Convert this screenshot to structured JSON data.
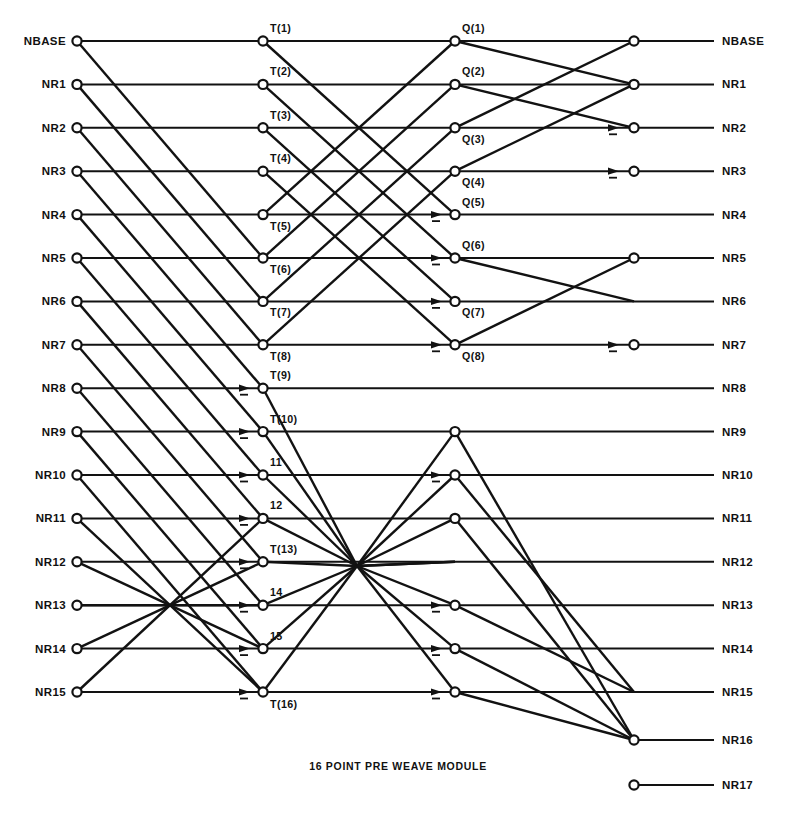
{
  "figure": {
    "caption": "16 POINT PRE WEAVE MODULE",
    "type": "butterfly-interconnect-network",
    "background": "#ffffff",
    "ink": "#121212"
  },
  "geometry": {
    "row_top_y": 41,
    "row_step_y": 43.4,
    "rows": 16,
    "col_input_x": 77,
    "col_t_x": 263,
    "col_q_x": 455,
    "col_out_x": 634,
    "label_in_x": 66,
    "label_out_x": 722,
    "line_left_x": 77,
    "line_right_x": 714,
    "hub_x": 357,
    "hub_y": 566,
    "extra_row_16_y": 740,
    "extra_row_17_y": 785
  },
  "inputs": {
    "labels": [
      "NBASE",
      "NR1",
      "NR2",
      "NR3",
      "NR4",
      "NR5",
      "NR6",
      "NR7",
      "NR8",
      "NR9",
      "NR10",
      "NR11",
      "NR12",
      "NR13",
      "NR14",
      "NR15"
    ]
  },
  "outputs": {
    "labels": [
      "NBASE",
      "NR1",
      "NR2",
      "NR3",
      "NR4",
      "NR5",
      "NR6",
      "NR7",
      "NR8",
      "NR9",
      "NR10",
      "NR11",
      "NR12",
      "NR13",
      "NR14",
      "NR15",
      "NR16",
      "NR17"
    ]
  },
  "stage_t": {
    "node_labels": [
      "T(1)",
      "T(2)",
      "T(3)",
      "T(4)",
      "T(5)",
      "T(6)",
      "T(7)",
      "T(8)",
      "T(9)",
      "T(10)",
      "11",
      "12",
      "T(13)",
      "14",
      "15",
      "T(16)"
    ]
  },
  "stage_q": {
    "node_labels": [
      "Q(1)",
      "Q(2)",
      "Q(3)",
      "Q(4)",
      "Q(5)",
      "Q(6)",
      "Q(7)",
      "Q(8)",
      "",
      "",
      "",
      "",
      "",
      "",
      "",
      ""
    ],
    "nodes_present_rows": [
      1,
      2,
      3,
      4,
      5,
      6,
      7,
      8,
      10,
      11,
      12,
      14,
      15,
      16
    ]
  },
  "stage_out": {
    "nodes_present_rows": [
      1,
      2,
      3,
      4,
      6,
      8
    ],
    "extra_nodes": [
      "NR16",
      "NR17"
    ]
  },
  "chart_data": {
    "type": "diagram",
    "title": "16 POINT PRE WEAVE MODULE",
    "columns": [
      "inputs",
      "T",
      "Q",
      "outputs"
    ],
    "input_count": 16,
    "output_count": 18,
    "t_node_count": 16,
    "q_node_count": 14
  },
  "edges": {
    "input_to_t_diagonals": [
      [
        1,
        6
      ],
      [
        2,
        7
      ],
      [
        3,
        8
      ],
      [
        4,
        9
      ],
      [
        5,
        10
      ],
      [
        6,
        11
      ],
      [
        7,
        12
      ],
      [
        8,
        13
      ],
      [
        9,
        14
      ],
      [
        10,
        15
      ],
      [
        11,
        16
      ],
      [
        12,
        16
      ],
      [
        13,
        15
      ],
      [
        14,
        14
      ],
      [
        15,
        13
      ],
      [
        16,
        12
      ]
    ],
    "t_to_q_diagonals": [
      [
        1,
        5
      ],
      [
        2,
        6
      ],
      [
        3,
        7
      ],
      [
        4,
        8
      ],
      [
        5,
        1
      ],
      [
        6,
        2
      ],
      [
        7,
        3
      ],
      [
        8,
        4
      ],
      [
        9,
        13
      ],
      [
        10,
        14
      ],
      [
        11,
        15
      ],
      [
        12,
        16
      ],
      [
        13,
        10
      ],
      [
        14,
        11
      ],
      [
        15,
        12
      ],
      [
        16,
        13
      ]
    ],
    "q_to_out_diagonals": [
      [
        1,
        2
      ],
      [
        2,
        3
      ],
      [
        3,
        1
      ],
      [
        4,
        2
      ],
      [
        6,
        7
      ],
      [
        8,
        6
      ],
      [
        10,
        17
      ],
      [
        11,
        16
      ],
      [
        12,
        17
      ],
      [
        14,
        16
      ],
      [
        15,
        17
      ],
      [
        16,
        17
      ]
    ]
  },
  "arrow_marks": {
    "t_column_rows": [
      9,
      10,
      11,
      12,
      13,
      14,
      15,
      16
    ],
    "q_column_rows": [
      5,
      6,
      7,
      8,
      11,
      14,
      15,
      16
    ],
    "out_column_rows": [
      3,
      4,
      8
    ]
  }
}
